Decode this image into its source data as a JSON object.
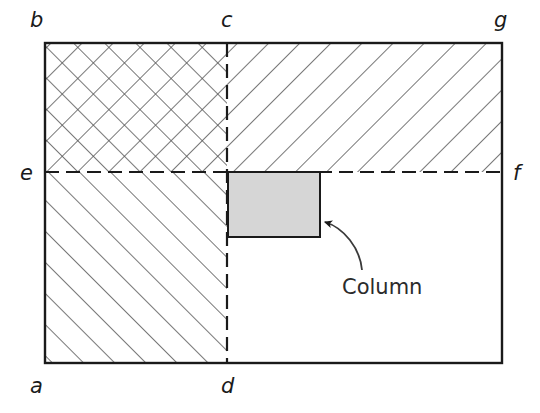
{
  "figure": {
    "background_color": "#ffffff",
    "line_color": "#1a1a1a",
    "hatch_color": "#555555",
    "column_fill_color": "#d6d6d6",
    "outer_rect": {
      "x": 45,
      "y": 43,
      "width": 457,
      "height": 320
    },
    "divider_vertical_x": 227,
    "divider_horizontal_y": 172,
    "vertex_labels": [
      {
        "id": "b",
        "text": "b",
        "x": 30,
        "y": 27
      },
      {
        "id": "c",
        "text": "c",
        "x": 221,
        "y": 27
      },
      {
        "id": "g",
        "text": "g",
        "x": 494,
        "y": 27
      },
      {
        "id": "e",
        "text": "e",
        "x": 20,
        "y": 180
      },
      {
        "id": "f",
        "text": "f",
        "x": 513,
        "y": 180
      },
      {
        "id": "a",
        "text": "a",
        "x": 30,
        "y": 393
      },
      {
        "id": "d",
        "text": "d",
        "x": 221,
        "y": 393
      }
    ],
    "regions": [
      {
        "id": "bcue-quadrant",
        "fill": "crosshatch",
        "x": 45,
        "y": 43,
        "width": 182,
        "height": 129
      },
      {
        "id": "cgf-quadrant",
        "fill": "diagonal-backslash",
        "x": 227,
        "y": 43,
        "width": 275,
        "height": 129
      },
      {
        "id": "aed-quadrant",
        "fill": "diagonal-slash",
        "x": 45,
        "y": 172,
        "width": 182,
        "height": 191
      },
      {
        "id": "dfg-quadrant",
        "fill": "none",
        "x": 227,
        "y": 172,
        "width": 275,
        "height": 191
      }
    ],
    "column": {
      "label": "Column",
      "x": 228,
      "y": 172,
      "width": 92,
      "height": 65,
      "label_x": 342,
      "label_y": 294
    },
    "callout_arrow": {
      "from_x": 362,
      "from_y": 270,
      "to_x": 324,
      "to_y": 222
    }
  }
}
